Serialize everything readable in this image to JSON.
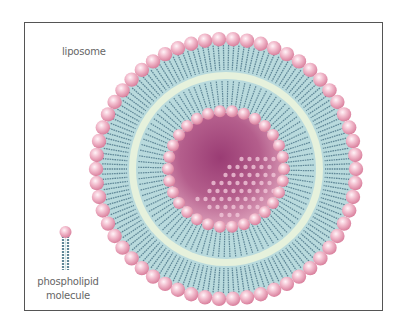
{
  "diagram": {
    "title_label": "liposome",
    "legend": {
      "line1": "phospholipid",
      "line2": "molecule"
    },
    "colors": {
      "head": "#e8a2b8",
      "head_highlight": "#fbe6ee",
      "tail": "#5f8797",
      "tail_light": "#bfe1e3",
      "middle_zone": "#e6f1dc",
      "core": "#a04c7e",
      "frame": "#555555"
    },
    "geometry": {
      "center": [
        226,
        169
      ],
      "outer_head_radius": 130,
      "mid_radius": 95,
      "inner_head_radius": 58,
      "outer_head_count": 58,
      "inner_head_count": 30
    }
  }
}
